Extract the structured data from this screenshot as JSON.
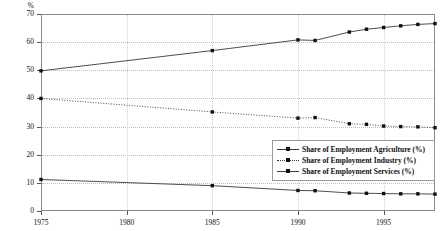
{
  "chart_data": {
    "type": "line",
    "title": "",
    "xlabel": "",
    "ylabel": "",
    "y_unit": "%",
    "xlim": [
      1975,
      1998
    ],
    "ylim": [
      0,
      70
    ],
    "y_ticks": [
      0,
      10,
      20,
      30,
      40,
      50,
      60,
      70
    ],
    "x_ticks": [
      1975,
      1980,
      1985,
      1990,
      1995
    ],
    "grid": "horizontal-dotted",
    "legend_position": "inside-bottom-right",
    "x": [
      1975,
      1985,
      1990,
      1991,
      1993,
      1994,
      1995,
      1996,
      1997,
      1998
    ],
    "series": [
      {
        "name": "Share of Employment Agriculture (%)",
        "line_style": "solid",
        "marker": "square",
        "values": [
          11.2,
          9.0,
          7.3,
          7.2,
          6.4,
          6.3,
          6.2,
          6.1,
          6.1,
          6.0
        ]
      },
      {
        "name": "Share of Employment Industry (%)",
        "line_style": "dotted",
        "marker": "square",
        "values": [
          40.0,
          35.2,
          33.0,
          33.2,
          31.0,
          30.8,
          30.2,
          30.0,
          29.9,
          29.6
        ]
      },
      {
        "name": "Share of Employment Services (%)",
        "line_style": "solid",
        "marker": "square",
        "values": [
          49.8,
          57.0,
          60.8,
          60.6,
          63.6,
          64.6,
          65.2,
          65.8,
          66.3,
          66.6
        ]
      }
    ]
  },
  "axis": {
    "y_unit_label": "%",
    "y_tick_labels": [
      "70",
      "60",
      "50",
      "40",
      "30",
      "20",
      "10",
      "0"
    ],
    "x_tick_labels": [
      "1975",
      "1980",
      "1985",
      "1990",
      "1995"
    ]
  },
  "legend": {
    "items": [
      {
        "label": "Share of Employment Agriculture (%)",
        "style": "solid"
      },
      {
        "label": "Share of Employment Industry (%)",
        "style": "dotted"
      },
      {
        "label": "Share of Employment Services (%)",
        "style": "solid"
      }
    ]
  },
  "colors": {
    "line": "#3a3a3a",
    "marker": "#111111",
    "grid": "#c9b9b9",
    "frame": "#8a8a8a",
    "background": "#ffffff"
  }
}
